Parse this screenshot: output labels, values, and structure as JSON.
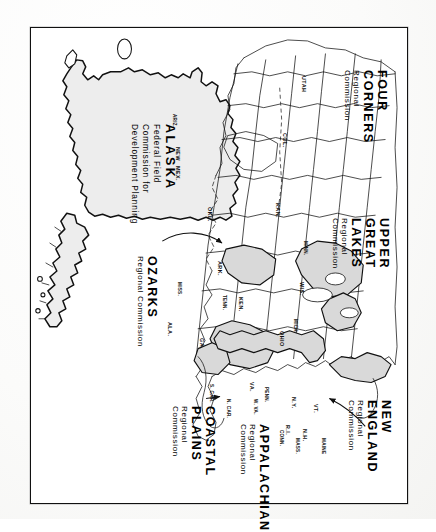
{
  "document": {
    "type": "map",
    "title": "Federal Regional Commissions of the United States",
    "orientation_note": "landscape map printed sideways; all labels rotated 90 degrees clockwise",
    "background_color": "#ffffff",
    "ink_color": "#111111",
    "region_fill_color": "#d8d8d8",
    "frame_color": "#111111"
  },
  "inset": {
    "name": "alaska-inset",
    "title": "ALASKA",
    "lines": [
      "Federal Field",
      "Commission for",
      "Development Planning"
    ]
  },
  "commissions": [
    {
      "id": "four-corners",
      "name": "FOUR CORNERS",
      "sub": "Regional Commission",
      "states": [
        "ARIZ.",
        "NEW MEX.",
        "UTAH",
        "COL."
      ]
    },
    {
      "id": "upper-great-lakes",
      "name": "UPPER\nGREAT\nLAKES",
      "name_lines": [
        "UPPER",
        "GREAT",
        "LAKES"
      ],
      "sub_lines": [
        "Regional",
        "Commission"
      ],
      "states": [
        "MINN.",
        "WIS.",
        "MICH."
      ]
    },
    {
      "id": "ozarks",
      "name": "OZARKS",
      "sub": "Regional Commission",
      "states": [
        "ARK.",
        "MISS.",
        "KAN.",
        "OKL."
      ]
    },
    {
      "id": "coastal-plains",
      "name_lines": [
        "COASTAL",
        "PLAINS"
      ],
      "sub_lines": [
        "Regional",
        "Commission"
      ],
      "states": [
        "S. CAR.",
        "N. CAR.",
        "GA."
      ]
    },
    {
      "id": "appalachian",
      "name": "APPALACHIAN",
      "sub_lines": [
        "Regional",
        "Commission"
      ],
      "states": [
        "PENN.",
        "W. VA.",
        "VA.",
        "TENN.",
        "KEN.",
        "ALA."
      ]
    },
    {
      "id": "new-england",
      "name": "NEW ENGLAND",
      "sub": "Regional Commission",
      "states": [
        "MAINE",
        "N.H.",
        "VT.",
        "MASS.",
        "CONN.",
        "R.I."
      ]
    }
  ],
  "state_labels": [
    {
      "text": "ARIZ.",
      "x": 176,
      "y": 113
    },
    {
      "text": "NEW",
      "x": 180,
      "y": 146
    },
    {
      "text": "MEX.",
      "x": 180,
      "y": 165
    },
    {
      "text": "UTAH",
      "x": 306,
      "y": 75
    },
    {
      "text": "COL.",
      "x": 287,
      "y": 132
    },
    {
      "text": "KAN.",
      "x": 280,
      "y": 202
    },
    {
      "text": "OKL.",
      "x": 212,
      "y": 206
    },
    {
      "text": "ARK.",
      "x": 222,
      "y": 260
    },
    {
      "text": "MISS.",
      "x": 181,
      "y": 281
    },
    {
      "text": "ALA.",
      "x": 172,
      "y": 321
    },
    {
      "text": "GA.",
      "x": 204,
      "y": 337
    },
    {
      "text": "TENN.",
      "x": 226,
      "y": 294
    },
    {
      "text": "KEN.",
      "x": 243,
      "y": 296
    },
    {
      "text": "MINN.",
      "x": 307,
      "y": 240
    },
    {
      "text": "WIS.",
      "x": 304,
      "y": 281
    },
    {
      "text": "MICH.",
      "x": 297,
      "y": 318
    },
    {
      "text": "OHIO",
      "x": 284,
      "y": 330
    },
    {
      "text": "N. CAR.",
      "x": 230,
      "y": 398
    },
    {
      "text": "S. CAR.",
      "x": 213,
      "y": 383
    },
    {
      "text": "VA.",
      "x": 254,
      "y": 381
    },
    {
      "text": "W. VA.",
      "x": 257,
      "y": 398
    },
    {
      "text": "PENN.",
      "x": 268,
      "y": 386
    },
    {
      "text": "N.Y.",
      "x": 296,
      "y": 396
    },
    {
      "text": "VT.",
      "x": 318,
      "y": 403
    },
    {
      "text": "N.H.",
      "x": 307,
      "y": 428
    },
    {
      "text": "MASS.",
      "x": 299,
      "y": 437
    },
    {
      "text": "CONN.",
      "x": 283,
      "y": 429
    },
    {
      "text": "R.I.",
      "x": 290,
      "y": 424
    },
    {
      "text": "MAINE",
      "x": 325,
      "y": 437
    }
  ],
  "label_blocks": {
    "four_corners": {
      "name": "FOUR CORNERS",
      "sub": "Regional Commission"
    },
    "upper_great_lakes": {
      "l1": "UPPER",
      "l2": "GREAT",
      "l3": "LAKES",
      "s1": "Regional",
      "s2": "Commission"
    },
    "ozarks": {
      "name": "OZARKS",
      "sub": "Regional Commission"
    },
    "coastal_plains": {
      "l1": "COASTAL",
      "l2": "PLAINS",
      "s1": "Regional",
      "s2": "Commission"
    },
    "appalachian": {
      "name": "APPALACHIAN",
      "s1": "Regional",
      "s2": "Commission"
    },
    "new_england": {
      "name": "NEW ENGLAND",
      "sub": "Regional Commission"
    }
  }
}
